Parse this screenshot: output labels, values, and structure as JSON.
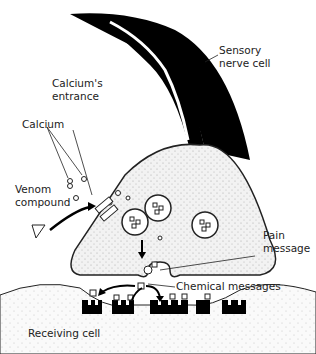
{
  "diagram": {
    "labels": {
      "sensory": "Sensory\nnerve cell",
      "sensory_l1": "Sensory",
      "sensory_l2": "nerve cell",
      "calcium_entrance_l1": "Calcium's",
      "calcium_entrance_l2": "entrance",
      "calcium": "Calcium",
      "venom_l1": "Venom",
      "venom_l2": "compound",
      "pain_l1": "Pain",
      "pain_l2": "message",
      "chemical_messages": "Chemical messages",
      "receiving_cell": "Receiving cell"
    },
    "colors": {
      "nerve": "#000000",
      "cell_fill": "#efefef",
      "outline": "#222222",
      "receptor": "#000000"
    }
  }
}
